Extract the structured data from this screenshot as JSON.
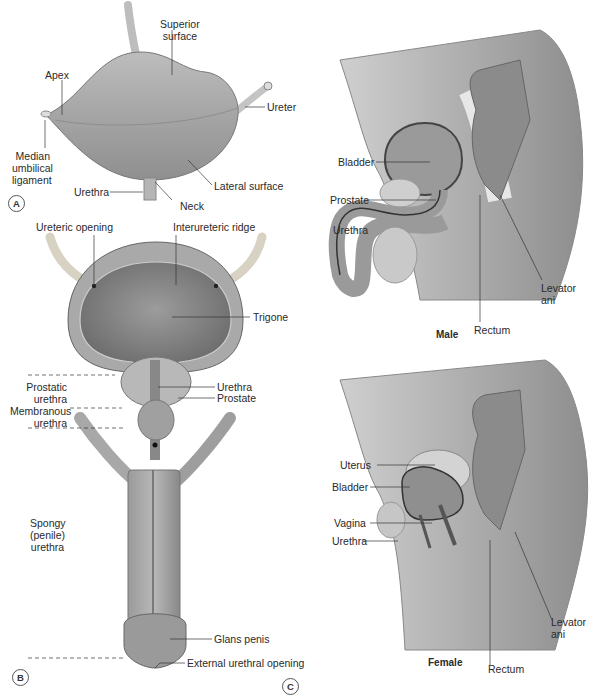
{
  "panels": {
    "a": {
      "letter": "A",
      "labels": {
        "superior_surface": "Superior\nsurface",
        "superior_line1": "Superior",
        "superior_line2": "surface",
        "apex": "Apex",
        "ureter": "Ureter",
        "median_line1": "Median",
        "median_line2": "umbilical",
        "median_line3": "ligament",
        "urethra": "Urethra",
        "lateral_surface": "Lateral surface",
        "neck": "Neck"
      }
    },
    "b": {
      "letter": "B",
      "labels": {
        "ureteric_opening": "Ureteric opening",
        "interureteric_ridge": "Interureteric ridge",
        "trigone": "Trigone",
        "prostatic_line1": "Prostatic",
        "prostatic_line2": "urethra",
        "urethra": "Urethra",
        "prostate": "Prostate",
        "membranous_line1": "Membranous",
        "membranous_line2": "urethra",
        "spongy_line1": "Spongy",
        "spongy_line2": "(penile)",
        "spongy_line3": "urethra",
        "glans_penis": "Glans penis",
        "external_urethral_opening": "External urethral opening"
      }
    },
    "c": {
      "letter": "C",
      "male": {
        "title": "Male",
        "labels": {
          "bladder": "Bladder",
          "prostate": "Prostate",
          "urethra": "Urethra",
          "levator_line1": "Levator",
          "levator_line2": "ani",
          "rectum": "Rectum"
        }
      },
      "female": {
        "title": "Female",
        "labels": {
          "uterus": "Uterus",
          "bladder": "Bladder",
          "vagina": "Vagina",
          "urethra": "Urethra",
          "levator_line1": "Levator",
          "levator_line2": "ani",
          "rectum": "Rectum"
        }
      }
    }
  },
  "colors": {
    "tissue_light": "#d9d9d9",
    "tissue_mid": "#b3b3b3",
    "tissue_dark": "#7a7a7a",
    "leader_line": "#333333",
    "background": "#ffffff"
  }
}
